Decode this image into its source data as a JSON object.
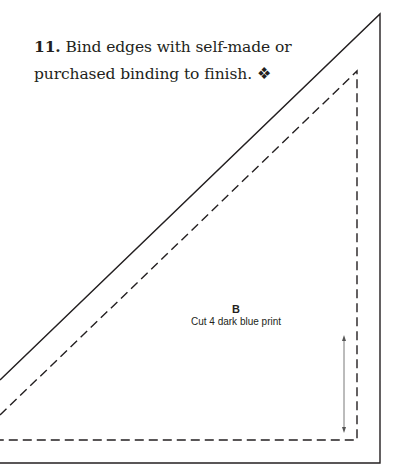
{
  "instruction": {
    "step_number": "11.",
    "text": " Bind edges with self-made or purchased binding to finish.",
    "end_mark": " ❖"
  },
  "template": {
    "piece_letter": "B",
    "cut_instruction": "Cut 4 dark blue print",
    "line_color": "#231f20",
    "arrow_color": "#555555"
  }
}
